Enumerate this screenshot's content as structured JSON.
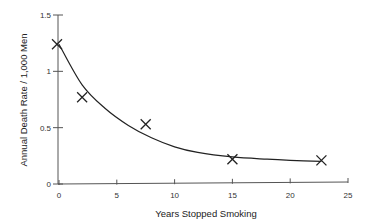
{
  "chart_data": {
    "type": "scatter",
    "title": "",
    "xlabel": "Years Stopped Smoking",
    "ylabel": "Annual Death Rate / 1,000 Men",
    "xlim": [
      0,
      25
    ],
    "ylim": [
      0,
      1.5
    ],
    "x_ticks": [
      "0",
      "5",
      "10",
      "15",
      "20",
      "25"
    ],
    "y_ticks": [
      "0",
      "0.5",
      "1",
      "1.5"
    ],
    "grid": false,
    "legend": null,
    "marker": "x",
    "series": [
      {
        "name": "Observed",
        "x": [
          0,
          2,
          7.5,
          15,
          22.7
        ],
        "y": [
          1.24,
          0.77,
          0.53,
          0.22,
          0.21
        ]
      }
    ],
    "fit_curve": {
      "description": "smooth decaying curve fit through points",
      "x": [
        0,
        2,
        4,
        6,
        8,
        10,
        12,
        15,
        18,
        20,
        22.7
      ],
      "y": [
        1.24,
        0.88,
        0.67,
        0.52,
        0.41,
        0.33,
        0.28,
        0.24,
        0.22,
        0.21,
        0.2
      ]
    }
  }
}
